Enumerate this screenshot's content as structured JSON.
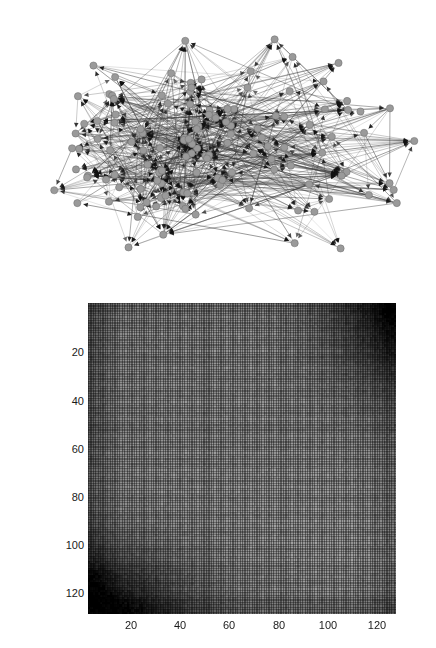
{
  "figure": {
    "background_color": "#ffffff",
    "panels": [
      {
        "id": "network",
        "type": "directed-graph"
      },
      {
        "id": "matrix",
        "type": "heatmap"
      }
    ]
  },
  "network": {
    "title": "",
    "node_color": "#9a9a9a",
    "node_stroke": "#6b6b6b",
    "edge_color": "#3a3a3a",
    "arrow_color": "#111111",
    "node_count": 128,
    "node_radius": 3.6,
    "edge_count": 640,
    "seed": 20240417
  },
  "chart_data": {
    "type": "heatmap",
    "title": "",
    "xlabel": "",
    "ylabel": "",
    "rows": 128,
    "cols": 128,
    "xlim": [
      1,
      128
    ],
    "ylim": [
      1,
      128
    ],
    "grid": true,
    "colormap": "gray",
    "vmin": 0,
    "vmax": 1,
    "x_ticks": [
      20,
      40,
      60,
      80,
      100,
      120
    ],
    "x_tick_labels": [
      "20",
      "40",
      "60",
      "80",
      "100",
      "120"
    ],
    "y_ticks": [
      20,
      40,
      60,
      80,
      100,
      120
    ],
    "y_tick_labels": [
      "20",
      "40",
      "60",
      "80",
      "100",
      "120"
    ],
    "hotspots": [
      {
        "name": "bottom-left-dark",
        "row_range": [
          110,
          128
        ],
        "col_range": [
          1,
          30
        ],
        "value": 0.12
      },
      {
        "name": "top-right-dark",
        "row_range": [
          1,
          30
        ],
        "col_range": [
          110,
          128
        ],
        "value": 0.14
      },
      {
        "name": "left-column-band",
        "row_range": [
          1,
          128
        ],
        "col_range": [
          1,
          12
        ],
        "value": 0.4
      },
      {
        "name": "right-column-band",
        "row_range": [
          1,
          128
        ],
        "col_range": [
          118,
          128
        ],
        "value": 0.42
      },
      {
        "name": "bottom-row-band",
        "row_range": [
          120,
          128
        ],
        "col_range": [
          1,
          128
        ],
        "value": 0.38
      },
      {
        "name": "mid-plateau",
        "row_range": [
          30,
          110
        ],
        "col_range": [
          20,
          110
        ],
        "value": 0.62
      }
    ],
    "base_value": 0.6,
    "grid_line_value": 0.3
  },
  "y_axis_ticks": [
    {
      "label": "20",
      "value": 20,
      "y": 352
    },
    {
      "label": "40",
      "value": 40,
      "y": 401
    },
    {
      "label": "60",
      "value": 60,
      "y": 449
    },
    {
      "label": "80",
      "value": 80,
      "y": 497
    },
    {
      "label": "100",
      "value": 100,
      "y": 545
    },
    {
      "label": "120",
      "value": 120,
      "y": 593
    }
  ],
  "x_axis_ticks": [
    {
      "label": "20",
      "value": 20,
      "x": 131
    },
    {
      "label": "40",
      "value": 40,
      "x": 180
    },
    {
      "label": "60",
      "value": 60,
      "x": 229
    },
    {
      "label": "80",
      "value": 80,
      "x": 279
    },
    {
      "label": "100",
      "value": 100,
      "x": 328
    },
    {
      "label": "120",
      "value": 120,
      "x": 377
    }
  ]
}
